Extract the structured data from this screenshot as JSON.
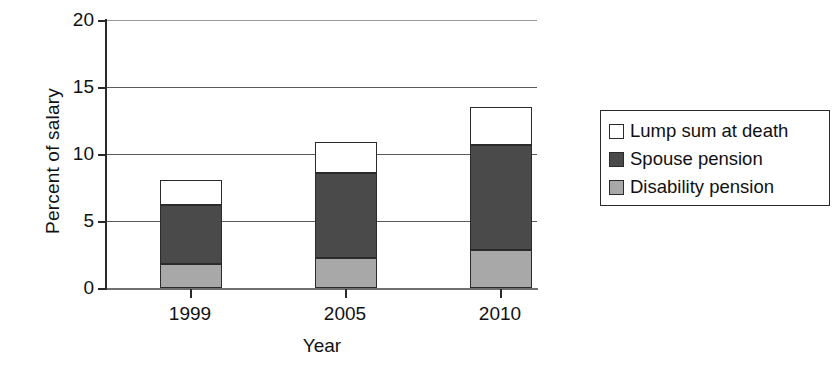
{
  "chart_data": {
    "type": "bar",
    "subtype": "stacked-bar",
    "title": "",
    "xlabel": "Year",
    "ylabel": "Percent of salary",
    "categories": [
      "1999",
      "2005",
      "2010"
    ],
    "ylim": [
      0,
      20
    ],
    "yticks": [
      0,
      5,
      10,
      15,
      20
    ],
    "ytick_labels": [
      "0",
      "5",
      "10",
      "15",
      "20"
    ],
    "grid": "horizontal",
    "legend_position": "right",
    "series": [
      {
        "name": "Lump sum at death",
        "color": "#ffffff",
        "values": [
          1.9,
          2.3,
          2.8
        ]
      },
      {
        "name": "Spouse pension",
        "color": "#4a4a4a",
        "values": [
          4.4,
          6.3,
          7.8
        ]
      },
      {
        "name": "Disability pension",
        "color": "#a8a8a8",
        "values": [
          1.8,
          2.3,
          2.9
        ]
      }
    ],
    "stack_order_bottom_to_top": [
      "Disability pension",
      "Spouse pension",
      "Lump sum at death"
    ],
    "totals": [
      8.1,
      10.9,
      13.5
    ],
    "cumulative_tops": {
      "1999": {
        "disability": 1.8,
        "spouse": 6.2,
        "lump": 8.1
      },
      "2005": {
        "disability": 2.3,
        "spouse": 8.6,
        "lump": 10.9
      },
      "2010": {
        "disability": 2.9,
        "spouse": 10.7,
        "lump": 13.5
      }
    }
  },
  "axes": {
    "y_title": "Percent of salary",
    "x_title": "Year",
    "y_labels": [
      "20",
      "15",
      "10",
      "5",
      "0"
    ],
    "x_labels": [
      "1999",
      "2005",
      "2010"
    ]
  },
  "legend": {
    "items": [
      {
        "label": "Lump sum at death",
        "swatch": "#ffffff"
      },
      {
        "label": "Spouse pension",
        "swatch": "#4a4a4a"
      },
      {
        "label": "Disability pension",
        "swatch": "#a8a8a8"
      }
    ]
  },
  "colors": {
    "lump_sum": "#ffffff",
    "spouse_pension": "#4a4a4a",
    "disability_pension": "#a8a8a8",
    "axis": "#2a2a2a",
    "gridline": "#5a5a5a",
    "background": "#ffffff"
  }
}
